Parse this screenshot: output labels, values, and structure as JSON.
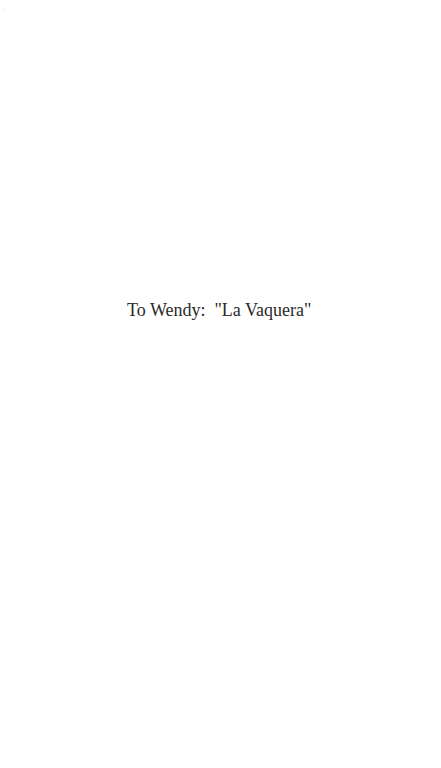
{
  "page": {
    "dedication": "To Wendy:  \"La Vaquera\""
  }
}
